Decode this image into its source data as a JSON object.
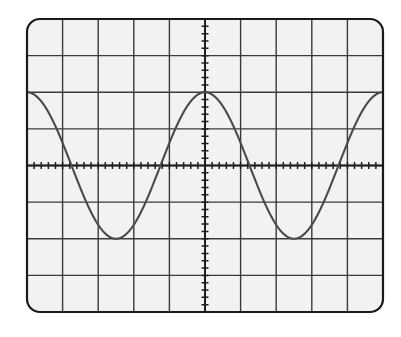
{
  "figure": {
    "kind": "oscilloscope-screen-photo",
    "caption_faint": "",
    "background_color": "#ffffff"
  },
  "screen": {
    "label": "oscilloscope-screen",
    "x": 27,
    "y": 19,
    "width": 356,
    "height": 293,
    "corner_radius": 13,
    "bezel_color": "#1a1a1a",
    "bezel_width": 2.2,
    "face_color": "#f2f2f0",
    "graticule_color": "#3a3a3a",
    "graticule_line_width": 1.4,
    "columns": 10,
    "rows": 8
  },
  "axes": {
    "center_vertical_label": "vertical-center-axis",
    "center_horizontal_label": "horizontal-center-axis",
    "axis_line_width": 2.0,
    "axis_color": "#1f1f1f",
    "minor_ticks_per_division": 5,
    "tick_length": 7,
    "tick_width": 1.5,
    "tick_color": "#1f1f1f"
  },
  "trace": {
    "label": "sine-wave-trace",
    "color": "#4a4a4a",
    "line_width": 2.1,
    "waveform": "sine",
    "amplitude_divisions": 2,
    "period_divisions": 5,
    "phase_description": "peak centered on the vertical center axis",
    "vertical_offset_divisions": 0,
    "cycles_visible": 2
  },
  "chart_data": {
    "type": "line",
    "xlabel": "",
    "ylabel": "",
    "xlim": [
      -5,
      5
    ],
    "ylim": [
      -4,
      4
    ],
    "grid": true,
    "grid_major_x": [
      -5,
      -4,
      -3,
      -2,
      -1,
      0,
      1,
      2,
      3,
      4,
      5
    ],
    "grid_major_y": [
      -4,
      -3,
      -2,
      -1,
      0,
      1,
      2,
      3,
      4
    ],
    "legend": null,
    "units": "divisions",
    "series": [
      {
        "name": "sine",
        "formula": "y = 2 * cos(2*pi*x/5)",
        "amplitude": 2,
        "period": 5,
        "x": [
          -5.0,
          -4.75,
          -4.5,
          -4.25,
          -4.0,
          -3.75,
          -3.5,
          -3.25,
          -3.0,
          -2.75,
          -2.5,
          -2.25,
          -2.0,
          -1.75,
          -1.5,
          -1.25,
          -1.0,
          -0.75,
          -0.5,
          -0.25,
          0.0,
          0.25,
          0.5,
          0.75,
          1.0,
          1.25,
          1.5,
          1.75,
          2.0,
          2.25,
          2.5,
          2.75,
          3.0,
          3.25,
          3.5,
          3.75,
          4.0,
          4.25,
          4.5,
          4.75,
          5.0
        ],
        "values": [
          2.0,
          1.9,
          1.62,
          1.18,
          0.62,
          0.0,
          -0.62,
          -1.18,
          -1.62,
          -1.9,
          -2.0,
          -1.9,
          -1.62,
          -1.18,
          -0.62,
          0.0,
          0.62,
          1.18,
          1.62,
          1.9,
          2.0,
          1.9,
          1.62,
          1.18,
          0.62,
          0.0,
          -0.62,
          -1.18,
          -1.62,
          -1.9,
          -2.0,
          -1.9,
          -1.62,
          -1.18,
          -0.62,
          0.0,
          0.62,
          1.18,
          1.62,
          1.9,
          2.0
        ]
      }
    ]
  }
}
